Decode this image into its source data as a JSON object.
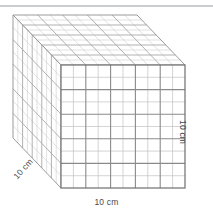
{
  "figure": {
    "shape": "cube",
    "projection": "oblique",
    "divisions_per_edge": 10,
    "labels": {
      "width": "10 cm",
      "height": "10 cm",
      "depth": "10 cm"
    },
    "colors": {
      "background": "#ffffff",
      "front_grid_line": "#8a8a8a",
      "front_grid_line_light": "#c2c2c2",
      "side_grid_line": "#b9b9b9",
      "side_grid_line_light": "#d9d9d9",
      "outline": "#6f6f6f",
      "top_rule": "#c9cdd2",
      "label_text": "#4a4a4a"
    }
  },
  "chart_data": {
    "type": "diagram",
    "shape": "cube",
    "edge_length_cm": 10,
    "unit_cube_edge_cm": 1,
    "divisions_per_edge": 10,
    "unit_cubes_total": 1000,
    "faces": [
      {
        "name": "front",
        "rows": 10,
        "cols": 10,
        "cells": 100
      },
      {
        "name": "top",
        "rows": 10,
        "cols": 10,
        "cells": 100
      },
      {
        "name": "left",
        "rows": 10,
        "cols": 10,
        "cells": 100
      }
    ],
    "annotations": [
      "10 cm",
      "10 cm",
      "10 cm"
    ],
    "axis_labels": {
      "width": "10 cm",
      "height": "10 cm",
      "depth": "10 cm"
    }
  }
}
